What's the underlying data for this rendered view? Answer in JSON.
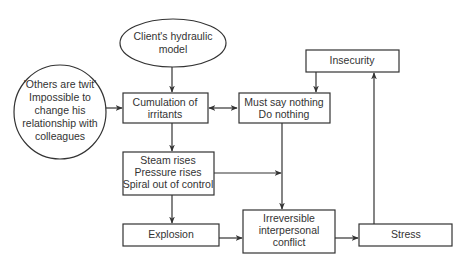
{
  "diagram": {
    "nodes": {
      "client_model": {
        "shape": "ellipse",
        "lines": [
          "Client's hydraulic",
          "model"
        ]
      },
      "others_twit": {
        "shape": "ellipse",
        "lines": [
          "'Others are twit'",
          "Impossible to",
          "change his",
          "relationship with",
          "colleagues"
        ]
      },
      "cumulation": {
        "shape": "rect",
        "lines": [
          "Cumulation of",
          "irritants"
        ]
      },
      "must_say_nothing": {
        "shape": "rect",
        "lines": [
          "Must say nothing",
          "Do nothing"
        ]
      },
      "insecurity": {
        "shape": "rect",
        "lines": [
          "Insecurity"
        ]
      },
      "steam_rises": {
        "shape": "rect",
        "lines": [
          "Steam rises",
          "Pressure rises",
          "Spiral out of control"
        ]
      },
      "explosion": {
        "shape": "rect",
        "lines": [
          "Explosion"
        ]
      },
      "irreversible_conflict": {
        "shape": "rect",
        "lines": [
          "Irreversible",
          "interpersonal",
          "conflict"
        ]
      },
      "stress": {
        "shape": "rect",
        "lines": [
          "Stress"
        ]
      }
    },
    "edges": [
      {
        "from": "client_model",
        "to": "cumulation",
        "direction": "forward"
      },
      {
        "from": "others_twit",
        "to": "cumulation",
        "direction": "forward"
      },
      {
        "from": "cumulation",
        "to": "must_say_nothing",
        "direction": "both"
      },
      {
        "from": "insecurity",
        "to": "must_say_nothing",
        "direction": "forward"
      },
      {
        "from": "cumulation",
        "to": "steam_rises",
        "direction": "forward"
      },
      {
        "from": "steam_rises",
        "to": "must_say_nothing_line",
        "direction": "forward"
      },
      {
        "from": "must_say_nothing",
        "to": "irreversible_conflict",
        "direction": "forward"
      },
      {
        "from": "steam_rises",
        "to": "explosion",
        "direction": "forward"
      },
      {
        "from": "explosion",
        "to": "irreversible_conflict",
        "direction": "forward"
      },
      {
        "from": "irreversible_conflict",
        "to": "stress",
        "direction": "forward"
      },
      {
        "from": "stress",
        "to": "insecurity",
        "direction": "forward"
      }
    ]
  }
}
